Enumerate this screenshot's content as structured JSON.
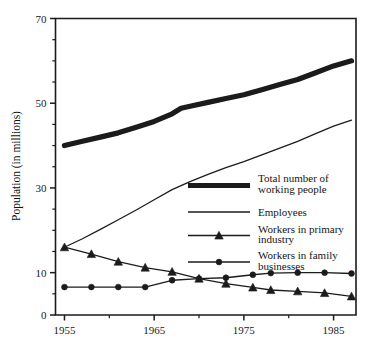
{
  "chart_data": {
    "type": "line",
    "title": "",
    "xlabel": "",
    "ylabel": "Population (in millions)",
    "xlim": [
      1954,
      1987.5
    ],
    "ylim": [
      0,
      70
    ],
    "grid": false,
    "legend_position": "center-right",
    "x_ticks_major": [
      1955,
      1965,
      1975,
      1985
    ],
    "x_tick_labels": [
      "1955",
      "1965",
      "1975",
      "1985"
    ],
    "x_ticks_minor": [
      1960,
      1970,
      1980
    ],
    "y_ticks_major": [
      0,
      10,
      30,
      50,
      70
    ],
    "y_tick_labels": [
      "0",
      "10",
      "30",
      "50",
      "70"
    ],
    "y_ticks_minor": [
      5,
      15,
      20,
      25,
      35,
      40,
      45,
      55,
      60,
      65
    ],
    "series": [
      {
        "name": "Total number of working people",
        "style": "thick-line",
        "marker": "none",
        "color": "#1b1b1b",
        "x": [
          1955,
          1957,
          1959,
          1961,
          1963,
          1965,
          1967,
          1968,
          1969,
          1971,
          1973,
          1975,
          1977,
          1979,
          1981,
          1983,
          1985,
          1987
        ],
        "values": [
          40.0,
          41.0,
          42.0,
          43.0,
          44.3,
          45.7,
          47.5,
          48.8,
          49.3,
          50.2,
          51.1,
          52.0,
          53.2,
          54.4,
          55.6,
          57.2,
          58.8,
          60.0
        ]
      },
      {
        "name": "Employees",
        "style": "thin-line",
        "marker": "none",
        "color": "#1b1b1b",
        "x": [
          1955,
          1957,
          1959,
          1961,
          1963,
          1965,
          1967,
          1969,
          1971,
          1973,
          1975,
          1977,
          1979,
          1981,
          1983,
          1985,
          1987
        ],
        "values": [
          16.0,
          18.0,
          20.2,
          22.5,
          24.8,
          27.2,
          29.6,
          31.5,
          33.2,
          34.8,
          36.2,
          37.8,
          39.4,
          41.0,
          42.8,
          44.6,
          46.0
        ]
      },
      {
        "name": "Workers in primary industry",
        "style": "thin-line",
        "marker": "triangle",
        "color": "#1b1b1b",
        "x": [
          1955,
          1958,
          1961,
          1964,
          1967,
          1970,
          1973,
          1976,
          1978,
          1981,
          1984,
          1987
        ],
        "values": [
          16.0,
          14.4,
          12.6,
          11.2,
          10.2,
          8.6,
          7.4,
          6.5,
          5.9,
          5.6,
          5.2,
          4.4
        ]
      },
      {
        "name": "Workers in family businesses",
        "style": "thin-line",
        "marker": "circle",
        "color": "#1b1b1b",
        "x": [
          1955,
          1958,
          1961,
          1964,
          1967,
          1970,
          1973,
          1976,
          1978,
          1981,
          1984,
          1987
        ],
        "values": [
          6.6,
          6.6,
          6.6,
          6.6,
          8.2,
          8.6,
          8.8,
          9.5,
          9.9,
          10.0,
          10.0,
          9.8
        ]
      }
    ]
  },
  "legend": {
    "entries": [
      {
        "label_line1": "Total number of",
        "label_line2": "working people",
        "style": "thick-line",
        "marker": "none"
      },
      {
        "label_line1": "Employees",
        "label_line2": "",
        "style": "thin-line",
        "marker": "none"
      },
      {
        "label_line1": "Workers in primary",
        "label_line2": "industry",
        "style": "thin-line",
        "marker": "triangle"
      },
      {
        "label_line1": "Workers in family",
        "label_line2": "businesses",
        "style": "thin-line",
        "marker": "circle"
      }
    ]
  },
  "colors": {
    "ink": "#1b1b1b",
    "background": "#ffffff"
  }
}
